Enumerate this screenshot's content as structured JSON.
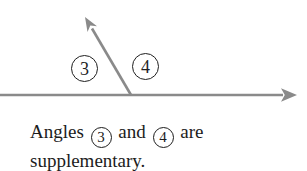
{
  "figure": {
    "line_color": "#8a8a8a",
    "ink_color": "#1f1f1f",
    "angle_labels": [
      {
        "text": "3"
      },
      {
        "text": "4"
      }
    ]
  },
  "caption": {
    "word1": "Angles",
    "circled1": "3",
    "word2": "and",
    "circled2": "4",
    "word3": "are",
    "line2": "supplementary."
  }
}
